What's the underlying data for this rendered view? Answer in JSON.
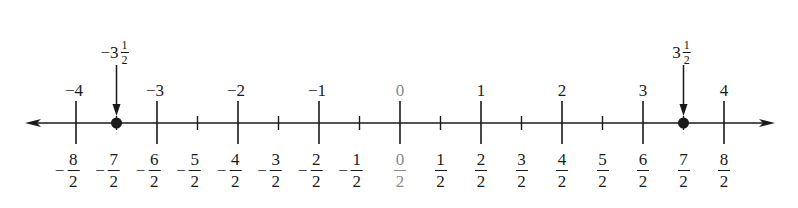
{
  "diagram": {
    "type": "number_line",
    "axis": {
      "min": -4,
      "max": 4,
      "x_zero": 400,
      "px_per_unit": 81,
      "y": 123,
      "left_tip": 25,
      "right_tip": 775
    },
    "integer_labels": [
      {
        "value": -4,
        "text": "−4",
        "highlight": false
      },
      {
        "value": -3,
        "text": "−3",
        "highlight": false
      },
      {
        "value": -2,
        "text": "−2",
        "highlight": false
      },
      {
        "value": -1,
        "text": "−1",
        "highlight": false
      },
      {
        "value": 0,
        "text": "0",
        "highlight": true
      },
      {
        "value": 1,
        "text": "1",
        "highlight": false
      },
      {
        "value": 2,
        "text": "2",
        "highlight": false
      },
      {
        "value": 3,
        "text": "3",
        "highlight": false
      },
      {
        "value": 4,
        "text": "4",
        "highlight": false
      }
    ],
    "half_labels": [
      {
        "value": -4,
        "sign": "−",
        "num": "8",
        "den": "2",
        "highlight": false
      },
      {
        "value": -3.5,
        "sign": "−",
        "num": "7",
        "den": "2",
        "highlight": false
      },
      {
        "value": -3,
        "sign": "−",
        "num": "6",
        "den": "2",
        "highlight": false
      },
      {
        "value": -2.5,
        "sign": "−",
        "num": "5",
        "den": "2",
        "highlight": false
      },
      {
        "value": -2,
        "sign": "−",
        "num": "4",
        "den": "2",
        "highlight": false
      },
      {
        "value": -1.5,
        "sign": "−",
        "num": "3",
        "den": "2",
        "highlight": false
      },
      {
        "value": -1,
        "sign": "−",
        "num": "2",
        "den": "2",
        "highlight": false
      },
      {
        "value": -0.5,
        "sign": "−",
        "num": "1",
        "den": "2",
        "highlight": false
      },
      {
        "value": 0,
        "sign": "",
        "num": "0",
        "den": "2",
        "highlight": true
      },
      {
        "value": 0.5,
        "sign": "",
        "num": "1",
        "den": "2",
        "highlight": false
      },
      {
        "value": 1,
        "sign": "",
        "num": "2",
        "den": "2",
        "highlight": false
      },
      {
        "value": 1.5,
        "sign": "",
        "num": "3",
        "den": "2",
        "highlight": false
      },
      {
        "value": 2,
        "sign": "",
        "num": "4",
        "den": "2",
        "highlight": false
      },
      {
        "value": 2.5,
        "sign": "",
        "num": "5",
        "den": "2",
        "highlight": false
      },
      {
        "value": 3,
        "sign": "",
        "num": "6",
        "den": "2",
        "highlight": false
      },
      {
        "value": 3.5,
        "sign": "",
        "num": "7",
        "den": "2",
        "highlight": false
      },
      {
        "value": 4,
        "sign": "",
        "num": "8",
        "den": "2",
        "highlight": false
      }
    ],
    "points": [
      {
        "value": -3.5,
        "whole": "−3",
        "num": "1",
        "den": "2"
      },
      {
        "value": 3.5,
        "whole": "3",
        "num": "1",
        "den": "2"
      }
    ],
    "colors": {
      "line": "#1a1a1a",
      "highlight": "#8a8a8a"
    }
  }
}
